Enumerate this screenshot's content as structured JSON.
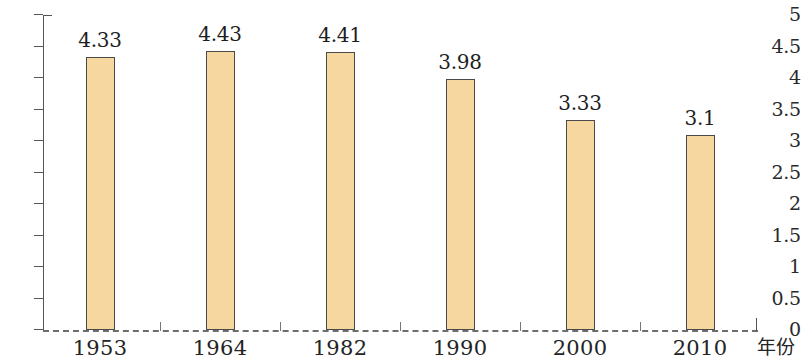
{
  "chart_data": {
    "type": "bar",
    "title": "",
    "subtitle": "",
    "xlabel": "年份",
    "ylabel": "",
    "categories": [
      "1953",
      "1964",
      "1982",
      "1990",
      "2000",
      "2010"
    ],
    "values": [
      4.33,
      4.43,
      4.41,
      3.98,
      3.33,
      3.1
    ],
    "value_labels": [
      "4.33",
      "4.43",
      "4.41",
      "3.98",
      "3.33",
      "3.1"
    ],
    "series": [
      {
        "name": "",
        "values": [
          4.33,
          4.43,
          4.41,
          3.98,
          3.33,
          3.1
        ]
      }
    ],
    "ylim": [
      0,
      5
    ],
    "xlim": null,
    "ytick_labels": [
      "0",
      "0.5",
      "1",
      "1.5",
      "2",
      "2.5",
      "3",
      "3.5",
      "4",
      "4.5",
      "5"
    ],
    "ytick_values": [
      0,
      0.5,
      1,
      1.5,
      2,
      2.5,
      3,
      3.5,
      4,
      4.5,
      5
    ],
    "grid": false,
    "legend": null,
    "legend_position": "none",
    "annotations": [],
    "bar_fill_color": "#f6d79f",
    "bar_border_color": "#4a4a4a",
    "axis_color": "#555555",
    "background_color": "#ffffff"
  }
}
